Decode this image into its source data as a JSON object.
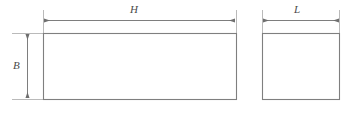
{
  "drawing": {
    "type": "engineering-dimension-diagram",
    "description": "Two-view orthographic outline of a rectangular block with dimension annotations",
    "background_color": "#ffffff",
    "line_color": "#8c8c8c",
    "outline_color": "#7a7a7a",
    "text_color": "#4a4a4a",
    "dimensions": [
      {
        "symbol": "H",
        "name": "height-dimension-horizontal",
        "orientation": "horizontal",
        "applies_to": "front-view-rectangle",
        "label_x": 130,
        "label_y": 4,
        "line_y": 20,
        "start_x": 43,
        "end_x": 236
      },
      {
        "symbol": "L",
        "name": "length-dimension",
        "orientation": "horizontal",
        "applies_to": "side-view-rectangle",
        "label_x": 294,
        "label_y": 4,
        "line_y": 20,
        "start_x": 262,
        "end_x": 340
      },
      {
        "symbol": "B",
        "name": "breadth-dimension",
        "orientation": "vertical",
        "applies_to": "front-view-rectangle",
        "label_x": 13,
        "label_y": 60,
        "line_x": 27,
        "start_y": 33,
        "end_y": 99
      }
    ],
    "shapes": [
      {
        "name": "front-view-rectangle",
        "x": 43,
        "y": 33,
        "width": 193,
        "height": 66
      },
      {
        "name": "side-view-rectangle",
        "x": 262,
        "y": 33,
        "width": 78,
        "height": 66
      }
    ]
  }
}
